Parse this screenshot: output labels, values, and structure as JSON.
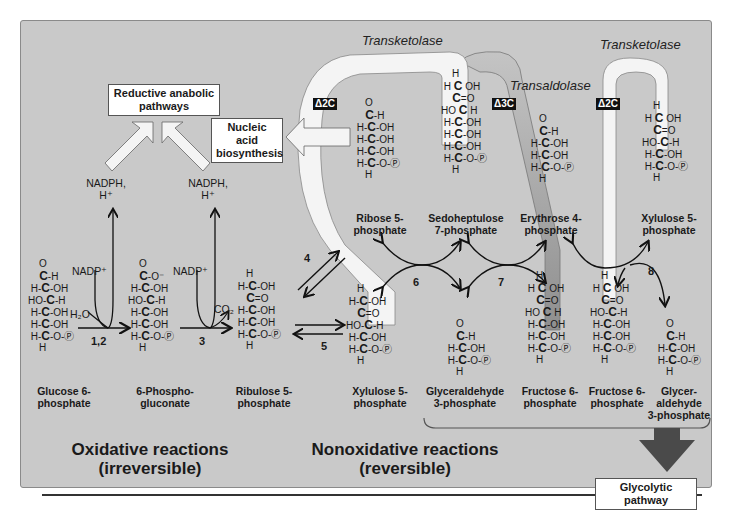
{
  "diagram": {
    "sections": {
      "oxidative": {
        "line1": "Oxidative reactions",
        "line2": "(irreversible)"
      },
      "nonoxidative": {
        "line1": "Nonoxidative reactions",
        "line2": "(reversible)"
      }
    },
    "boxes": {
      "reductive": {
        "line1": "Reductive anabolic",
        "line2": "pathways"
      },
      "nucleic": {
        "line1": "Nucleic acid",
        "line2": "biosynthesis"
      },
      "glycolytic": "Glycolytic pathway"
    },
    "enzymes": {
      "transketolase_1": "Transketolase",
      "transaldolase": "Transaldolase",
      "transketolase_2": "Transketolase"
    },
    "deltas": {
      "d1": "Δ2C",
      "d2": "Δ3C",
      "d3": "Δ2C"
    },
    "cofactors": {
      "nadph_1": {
        "line1": "NADPH,",
        "line2": "H⁺"
      },
      "nadph_2": {
        "line1": "NADPH,",
        "line2": "H⁺"
      },
      "nadp_1": "NADP⁺",
      "nadp_2": "NADP⁺",
      "h2o": "H₂O",
      "co2": "CO₂"
    },
    "reaction_numbers": {
      "r12": "1,2",
      "r3": "3",
      "r4": "4",
      "r5": "5",
      "r6": "6",
      "r7": "7",
      "r8": "8"
    },
    "molecules": [
      {
        "id": "glucose6p",
        "line1": "Glucose 6-",
        "line2": "phosphate"
      },
      {
        "id": "phosphogluconate",
        "line1": "6-Phospho-",
        "line2": "gluconate"
      },
      {
        "id": "ribulose5p",
        "line1": "Ribulose 5-",
        "line2": "phosphate"
      },
      {
        "id": "xylulose5p_a",
        "line1": "Xylulose 5-",
        "line2": "phosphate"
      },
      {
        "id": "ribose5p",
        "line1": "Ribose 5-",
        "line2": "phosphate"
      },
      {
        "id": "sedoheptulose7p",
        "line1": "Sedoheptulose",
        "line2": "7-phosphate"
      },
      {
        "id": "erythrose4p",
        "line1": "Erythrose 4-",
        "line2": "phosphate"
      },
      {
        "id": "xylulose5p_b",
        "line1": "Xylulose 5-",
        "line2": "phosphate"
      },
      {
        "id": "glyceraldehyde3p_a",
        "line1": "Glyceraldehyde",
        "line2": "3-phosphate"
      },
      {
        "id": "fructose6p_a",
        "line1": "Fructose 6-",
        "line2": "phosphate"
      },
      {
        "id": "fructose6p_b",
        "line1": "Fructose 6-",
        "line2": "phosphate"
      },
      {
        "id": "glyceraldehyde3p_b",
        "line1": "Glycer-",
        "line2": "aldehyde",
        "line3": "3-phosphate"
      }
    ],
    "colors": {
      "panel": "#c9c9c9",
      "ribbon": "#f4f4f4",
      "transaldolase_ribbon": "#a9a9a9",
      "arrow_dark": "#4a4a4a"
    }
  }
}
